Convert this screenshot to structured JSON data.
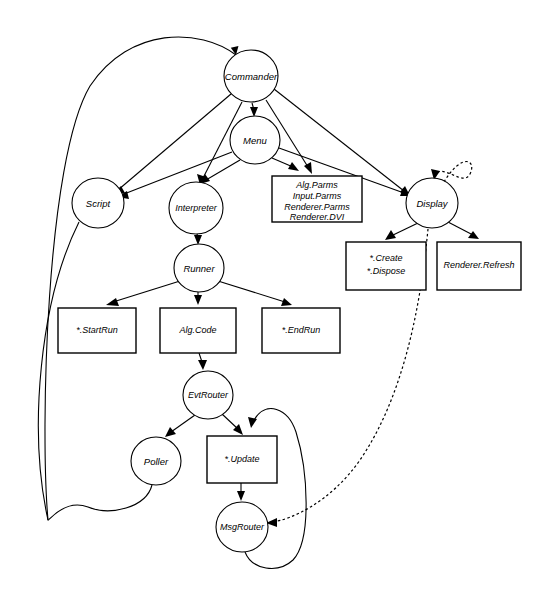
{
  "diagram": {
    "background_color": "#ffffff",
    "stroke_color": "#000000",
    "width": 535,
    "height": 602,
    "nodes": [
      {
        "id": "commander",
        "label": "Commander",
        "shape": "ellipse",
        "cx": 251,
        "cy": 76,
        "rx": 27,
        "ry": 26
      },
      {
        "id": "menu",
        "label": "Menu",
        "shape": "ellipse",
        "cx": 255,
        "cy": 140,
        "rx": 25,
        "ry": 24
      },
      {
        "id": "script",
        "label": "Script",
        "shape": "ellipse",
        "cx": 98,
        "cy": 203,
        "rx": 26,
        "ry": 25
      },
      {
        "id": "interpreter",
        "label": "Interpreter",
        "shape": "ellipse",
        "cx": 196,
        "cy": 208,
        "rx": 27,
        "ry": 26
      },
      {
        "id": "display",
        "label": "Display",
        "shape": "ellipse",
        "cx": 432,
        "cy": 203,
        "rx": 26,
        "ry": 25
      },
      {
        "id": "runner",
        "label": "Runner",
        "shape": "ellipse",
        "cx": 199,
        "cy": 268,
        "rx": 25,
        "ry": 24
      },
      {
        "id": "evtrouter",
        "label": "EvtRouter",
        "shape": "ellipse",
        "cx": 208,
        "cy": 395,
        "rx": 25,
        "ry": 24
      },
      {
        "id": "poller",
        "label": "Poller",
        "shape": "ellipse",
        "cx": 156,
        "cy": 461,
        "rx": 25,
        "ry": 24
      },
      {
        "id": "msgrouter",
        "label": "MsgRouter",
        "shape": "ellipse",
        "cx": 242,
        "cy": 527,
        "rx": 26,
        "ry": 25
      }
    ],
    "boxes": [
      {
        "id": "parms-box",
        "shape": "rect",
        "x": 272,
        "y": 176,
        "w": 90,
        "h": 46,
        "lines": [
          "Alg.Parms",
          "Input.Parms",
          "Renderer.Parms",
          "Renderer.DVI"
        ]
      },
      {
        "id": "create-dispose-box",
        "shape": "rect",
        "x": 346,
        "y": 242,
        "w": 80,
        "h": 48,
        "lines": [
          "*.Create",
          "*.Dispose"
        ]
      },
      {
        "id": "renderer-refresh-box",
        "shape": "rect",
        "x": 437,
        "y": 242,
        "w": 84,
        "h": 48,
        "lines": [
          "Renderer.Refresh"
        ]
      },
      {
        "id": "startrun-box",
        "shape": "rect",
        "x": 58,
        "y": 308,
        "w": 78,
        "h": 45,
        "lines": [
          "*.StartRun"
        ]
      },
      {
        "id": "algcode-box",
        "shape": "rect",
        "x": 160,
        "y": 308,
        "w": 76,
        "h": 45,
        "lines": [
          "Alg.Code"
        ]
      },
      {
        "id": "endrun-box",
        "shape": "rect",
        "x": 262,
        "y": 308,
        "w": 78,
        "h": 45,
        "lines": [
          "*.EndRun"
        ]
      },
      {
        "id": "update-box",
        "shape": "rect",
        "x": 207,
        "y": 436,
        "w": 70,
        "h": 47,
        "lines": [
          "*.Update"
        ]
      }
    ],
    "edges": [
      {
        "id": "script-to-commander",
        "from": "script",
        "to": "commander",
        "style": "solid",
        "arrow": true
      },
      {
        "id": "commander-to-menu",
        "from": "commander",
        "to": "menu",
        "style": "solid",
        "arrow": true
      },
      {
        "id": "commander-to-script",
        "from": "commander",
        "to": "script",
        "style": "solid",
        "arrow": true
      },
      {
        "id": "commander-to-interpreter",
        "from": "commander",
        "to": "interpreter",
        "style": "solid",
        "arrow": true
      },
      {
        "id": "commander-to-parms",
        "from": "commander",
        "to": "parms-box",
        "style": "solid",
        "arrow": true
      },
      {
        "id": "commander-to-display",
        "from": "commander",
        "to": "display",
        "style": "solid",
        "arrow": true
      },
      {
        "id": "menu-to-script",
        "from": "menu",
        "to": "script",
        "style": "solid",
        "arrow": true
      },
      {
        "id": "menu-to-interpreter",
        "from": "menu",
        "to": "interpreter",
        "style": "solid",
        "arrow": true
      },
      {
        "id": "menu-to-parms",
        "from": "menu",
        "to": "parms-box",
        "style": "solid",
        "arrow": true
      },
      {
        "id": "menu-to-display",
        "from": "menu",
        "to": "display",
        "style": "solid",
        "arrow": true
      },
      {
        "id": "interpreter-to-runner",
        "from": "interpreter",
        "to": "runner",
        "style": "solid",
        "arrow": true
      },
      {
        "id": "display-self-loop",
        "from": "display",
        "to": "display",
        "style": "dotted",
        "arrow": true
      },
      {
        "id": "display-to-create",
        "from": "display",
        "to": "create-dispose-box",
        "style": "solid",
        "arrow": true
      },
      {
        "id": "display-to-refresh",
        "from": "display",
        "to": "renderer-refresh-box",
        "style": "solid",
        "arrow": true
      },
      {
        "id": "display-to-msgrouter",
        "from": "display",
        "to": "msgrouter",
        "style": "dotted",
        "arrow": true
      },
      {
        "id": "runner-to-startrun",
        "from": "runner",
        "to": "startrun-box",
        "style": "solid",
        "arrow": true
      },
      {
        "id": "runner-to-algcode",
        "from": "runner",
        "to": "algcode-box",
        "style": "solid",
        "arrow": true
      },
      {
        "id": "runner-to-endrun",
        "from": "runner",
        "to": "endrun-box",
        "style": "solid",
        "arrow": true
      },
      {
        "id": "algcode-to-evtrouter",
        "from": "algcode-box",
        "to": "evtrouter",
        "style": "solid",
        "arrow": true
      },
      {
        "id": "evtrouter-to-poller",
        "from": "evtrouter",
        "to": "poller",
        "style": "solid",
        "arrow": true
      },
      {
        "id": "evtrouter-to-update",
        "from": "evtrouter",
        "to": "update-box",
        "style": "solid",
        "arrow": true
      },
      {
        "id": "update-to-msgrouter",
        "from": "update-box",
        "to": "msgrouter",
        "style": "solid",
        "arrow": true
      },
      {
        "id": "msgrouter-to-update",
        "from": "msgrouter",
        "to": "update-box",
        "style": "solid",
        "arrow": true
      },
      {
        "id": "poller-to-commander",
        "from": "poller",
        "to": "commander",
        "style": "solid",
        "arrow": true
      }
    ]
  }
}
